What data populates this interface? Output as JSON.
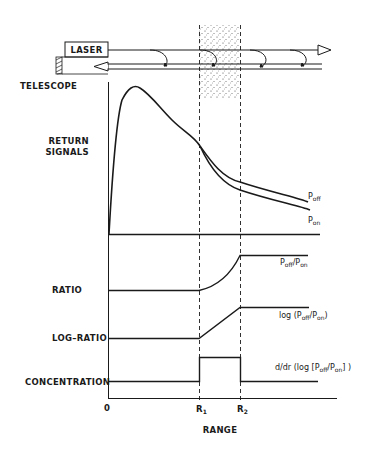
{
  "diagram": {
    "apparatus": {
      "laser_label": "LASER",
      "telescope_label": "TELESCOPE"
    },
    "panels": [
      {
        "id": "return-signals",
        "label_line1": "RETURN",
        "label_line2": "SIGNALS"
      },
      {
        "id": "ratio",
        "label": "RATIO"
      },
      {
        "id": "log-ratio",
        "label": "LOG–RATIO"
      },
      {
        "id": "concentration",
        "label": "CONCENTRATION"
      }
    ],
    "curve_labels": {
      "p_off": {
        "main": "P",
        "sub": "off"
      },
      "p_on": {
        "main": "P",
        "sub": "on"
      },
      "ratio": {
        "p1": "P",
        "s1": "off",
        "slash": "/",
        "p2": "P",
        "s2": "on"
      },
      "log_ratio": {
        "pre": "log (",
        "p1": "P",
        "s1": "off",
        "slash": "/",
        "p2": "P",
        "s2": "on",
        "post": ")"
      },
      "derivative": {
        "pre": "d/dr (log [",
        "p1": "P",
        "s1": "off",
        "slash": "/",
        "p2": "P",
        "s2": "on",
        "post": "] )"
      }
    },
    "axis": {
      "origin_label": "0",
      "r1_label": "R",
      "r1_sub": "1",
      "r2_label": "R",
      "r2_sub": "2",
      "x_label": "RANGE"
    },
    "colors": {
      "ink": "#1a1a1a",
      "background": "#ffffff"
    }
  }
}
